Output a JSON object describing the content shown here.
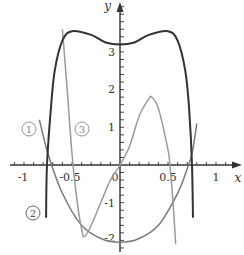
{
  "chart_data": {
    "type": "line",
    "title": "",
    "xlabel": "x",
    "ylabel": "y",
    "xlim": [
      -1.2,
      1.25
    ],
    "ylim": [
      -2.3,
      4.3
    ],
    "x_ticks": [
      {
        "value": -1,
        "label": "-1"
      },
      {
        "value": -0.5,
        "label": "-0.5"
      },
      {
        "value": 0,
        "label": "0"
      },
      {
        "value": 0.5,
        "label": "0.5"
      },
      {
        "value": 1,
        "label": "1"
      }
    ],
    "y_ticks": [
      {
        "value": -2,
        "label": "-2"
      },
      {
        "value": -1,
        "label": "-1"
      },
      {
        "value": 1,
        "label": "1"
      },
      {
        "value": 2,
        "label": "2"
      },
      {
        "value": 3,
        "label": "3"
      }
    ],
    "grid": false,
    "series": [
      {
        "name": "1",
        "label": "①",
        "color": "#7a7a7a",
        "description": "upward parabola, minimum about -2.05 at x=0",
        "points": [
          [
            -0.84,
            1.2
          ],
          [
            -0.75,
            0.3
          ],
          [
            -0.6,
            -0.75
          ],
          [
            -0.4,
            -1.6
          ],
          [
            -0.2,
            -1.95
          ],
          [
            0,
            -2.05
          ],
          [
            0.2,
            -1.95
          ],
          [
            0.4,
            -1.6
          ],
          [
            0.6,
            -0.75
          ],
          [
            0.7,
            -0.1
          ],
          [
            0.75,
            0.3
          ],
          [
            0.8,
            1.1
          ]
        ]
      },
      {
        "name": "2",
        "label": "②",
        "color": "#333333",
        "description": "dark curve: steep walls, two maxima ~3.55 at x=±0.5, local min ~3.2 at x=0",
        "points": [
          [
            -0.77,
            -1.4
          ],
          [
            -0.76,
            0
          ],
          [
            -0.72,
            1.5
          ],
          [
            -0.68,
            2.5
          ],
          [
            -0.6,
            3.3
          ],
          [
            -0.5,
            3.55
          ],
          [
            -0.3,
            3.45
          ],
          [
            -0.15,
            3.25
          ],
          [
            0,
            3.2
          ],
          [
            0.15,
            3.25
          ],
          [
            0.3,
            3.45
          ],
          [
            0.5,
            3.55
          ],
          [
            0.6,
            3.3
          ],
          [
            0.68,
            2.5
          ],
          [
            0.72,
            1.5
          ],
          [
            0.75,
            0
          ],
          [
            0.76,
            -1.4
          ]
        ]
      },
      {
        "name": "3",
        "label": "③",
        "color": "#9a9a9a",
        "description": "gray oscillating curve: minimum ~-1.9 at x≈-0.37, maximum ~1.8 at x≈0.33",
        "points": [
          [
            -0.6,
            3.6
          ],
          [
            -0.55,
            2.0
          ],
          [
            -0.5,
            0.3
          ],
          [
            -0.45,
            -0.9
          ],
          [
            -0.4,
            -1.7
          ],
          [
            -0.37,
            -1.9
          ],
          [
            -0.3,
            -1.6
          ],
          [
            -0.2,
            -1.0
          ],
          [
            -0.1,
            -0.4
          ],
          [
            0,
            0
          ],
          [
            0.1,
            0.5
          ],
          [
            0.2,
            1.3
          ],
          [
            0.3,
            1.75
          ],
          [
            0.33,
            1.8
          ],
          [
            0.4,
            1.5
          ],
          [
            0.5,
            0.4
          ],
          [
            0.52,
            0
          ],
          [
            0.55,
            -0.9
          ],
          [
            0.58,
            -2.1
          ]
        ]
      }
    ],
    "annotations": [
      {
        "text": "①",
        "x": -0.95,
        "y": 0.95
      },
      {
        "text": "③",
        "x": -0.4,
        "y": 0.95
      },
      {
        "text": "②",
        "x": -0.92,
        "y": -1.3
      }
    ],
    "legend": null
  }
}
